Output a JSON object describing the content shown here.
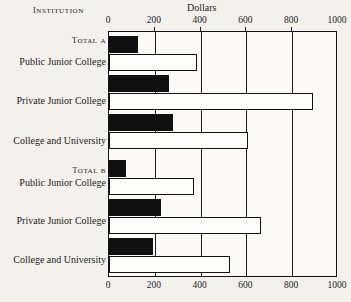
{
  "header": {
    "institution_label": "Institution",
    "chart_title": "Dollars"
  },
  "axis": {
    "ticks": [
      "0",
      "200",
      "400",
      "600",
      "800",
      "1000"
    ]
  },
  "groups": [
    {
      "name": "Total A"
    },
    {
      "name": "Total B"
    }
  ],
  "rows": [
    {
      "label": "Public Junior College"
    },
    {
      "label": "Private Junior College"
    },
    {
      "label": "College and University"
    },
    {
      "label": "Public Junior College"
    },
    {
      "label": "Private Junior College"
    },
    {
      "label": "College and University"
    }
  ],
  "chart_data": {
    "type": "bar",
    "orientation": "horizontal",
    "title": "Dollars",
    "xlabel": "Dollars",
    "ylabel": "Institution",
    "xlim": [
      0,
      1000
    ],
    "xticks": [
      0,
      200,
      400,
      600,
      800,
      1000
    ],
    "grid": true,
    "legend": "none",
    "categories": [
      "Total A - Public Junior College",
      "Total A - Private Junior College",
      "Total A - College and University",
      "Total B - Public Junior College",
      "Total B - Private Junior College",
      "Total B - College and University"
    ],
    "series": [
      {
        "name": "Black bar",
        "style": "filled-black",
        "values": [
          130,
          265,
          285,
          75,
          230,
          195
        ]
      },
      {
        "name": "White bar",
        "style": "outlined-white",
        "values": [
          390,
          900,
          615,
          375,
          670,
          535
        ]
      }
    ],
    "groups": [
      {
        "name": "Total A",
        "categories": [
          "Public Junior College",
          "Private Junior College",
          "College and University"
        ],
        "black": [
          130,
          265,
          285
        ],
        "white": [
          390,
          900,
          615
        ]
      },
      {
        "name": "Total B",
        "categories": [
          "Public Junior College",
          "Private Junior College",
          "College and University"
        ],
        "black": [
          75,
          230,
          195
        ],
        "white": [
          375,
          670,
          535
        ]
      }
    ]
  }
}
